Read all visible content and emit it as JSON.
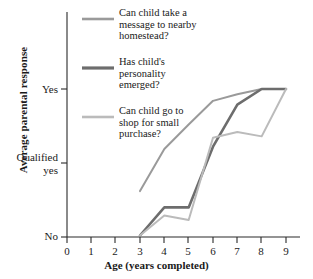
{
  "chart_data": {
    "type": "line",
    "title": "",
    "xlabel": "Age (years completed)",
    "ylabel": "Average parental response",
    "xticks": [
      "0",
      "1",
      "2",
      "3",
      "4",
      "5",
      "6",
      "7",
      "8",
      "9"
    ],
    "yticks": [
      "Yes",
      "Qualified\nyes",
      "No"
    ],
    "ylim": [
      0,
      2
    ],
    "xlim": [
      0,
      9
    ],
    "grid": false,
    "legend_position": "upper-left-inside",
    "series": [
      {
        "name": "Can child take a message to nearby homestead?",
        "legend_label": "Can child take a\nmessage to nearby\nhomestead?",
        "color": "#9a9a9a",
        "width": 2,
        "x": [
          3,
          4,
          5,
          6,
          7,
          8,
          9
        ],
        "y": [
          0.62,
          1.19,
          1.52,
          1.84,
          1.93,
          2.0,
          2.0
        ]
      },
      {
        "name": "Has child's personality emerged?",
        "legend_label": "Has child's\npersonality\nemerged?",
        "color": "#6d6d6d",
        "width": 2.6,
        "x": [
          3,
          4,
          5,
          6,
          7,
          8,
          9
        ],
        "y": [
          0.02,
          0.4,
          0.4,
          1.22,
          1.79,
          2.0,
          2.0
        ]
      },
      {
        "name": "Can child go to shop for small purchase?",
        "legend_label": "Can child go to\nshop for small\npurchase?",
        "color": "#bbbbbb",
        "width": 2,
        "x": [
          3,
          4,
          5,
          6,
          7,
          8,
          9
        ],
        "y": [
          0.02,
          0.29,
          0.23,
          1.34,
          1.42,
          1.36,
          2.0
        ]
      }
    ]
  },
  "axis": {
    "y_label": "Average parental response",
    "x_label": "Age (years completed)",
    "y_tick_yes": "Yes",
    "y_tick_qualified_1": "Qualified",
    "y_tick_qualified_2": "yes",
    "y_tick_no": "No",
    "x_tick_0": "0",
    "x_tick_1": "1",
    "x_tick_2": "2",
    "x_tick_3": "3",
    "x_tick_4": "4",
    "x_tick_5": "5",
    "x_tick_6": "6",
    "x_tick_7": "7",
    "x_tick_8": "8",
    "x_tick_9": "9"
  },
  "legend": {
    "item_1": "Can child take a\nmessage to nearby\nhomestead?",
    "item_2": "Has child's\npersonality\nemerged?",
    "item_3": "Can child go to\nshop for small\npurchase?"
  }
}
